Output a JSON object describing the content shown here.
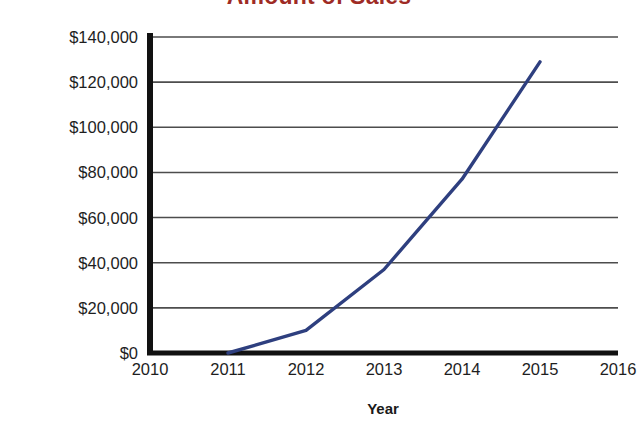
{
  "chart_data": {
    "type": "line",
    "title": "Amount of Sales",
    "xlabel": "Year",
    "ylabel": "Dollars",
    "x": [
      2011,
      2012,
      2013,
      2014,
      2015
    ],
    "values": [
      0,
      10000,
      37000,
      77000,
      129000
    ],
    "series": [
      {
        "name": "Amount of Sales",
        "values": [
          0,
          10000,
          37000,
          77000,
          129000
        ],
        "color": "#2e3f7f"
      }
    ],
    "xlim": [
      2010,
      2016
    ],
    "ylim": [
      0,
      140000
    ],
    "xticks": [
      2010,
      2011,
      2012,
      2013,
      2014,
      2015,
      2016
    ],
    "xtick_labels": [
      "2010",
      "2011",
      "2012",
      "2013",
      "2014",
      "2015",
      "2016"
    ],
    "yticks": [
      0,
      20000,
      40000,
      60000,
      80000,
      100000,
      120000,
      140000
    ],
    "ytick_labels": [
      "$0",
      "$20,000",
      "$40,000",
      "$60,000",
      "$80,000",
      "$100,000",
      "$120,000",
      "$140,000"
    ],
    "grid": "horizontal",
    "legend": "none",
    "title_color": "#9e2b25",
    "line_color": "#2e3f7f",
    "axis_color": "#111111",
    "grid_color": "#4d4d4d"
  }
}
